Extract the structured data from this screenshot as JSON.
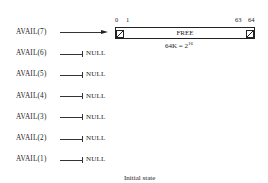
{
  "diagram": {
    "caption": "Initial state",
    "block": {
      "label": "FREE",
      "size_formula_base": "64K = 2",
      "size_formula_exp": "16",
      "indices": {
        "left_start": "0",
        "left_next": "1",
        "right_prev": "63",
        "right_end": "64"
      }
    },
    "avail": [
      {
        "label": "AVAIL(7)",
        "target": "block"
      },
      {
        "label": "AVAIL(6)",
        "target": "NULL"
      },
      {
        "label": "AVAIL(5)",
        "target": "NULL"
      },
      {
        "label": "AVAIL(4)",
        "target": "NULL"
      },
      {
        "label": "AVAIL(3)",
        "target": "NULL"
      },
      {
        "label": "AVAIL(2)",
        "target": "NULL"
      },
      {
        "label": "AVAIL(1)",
        "target": "NULL"
      }
    ]
  }
}
